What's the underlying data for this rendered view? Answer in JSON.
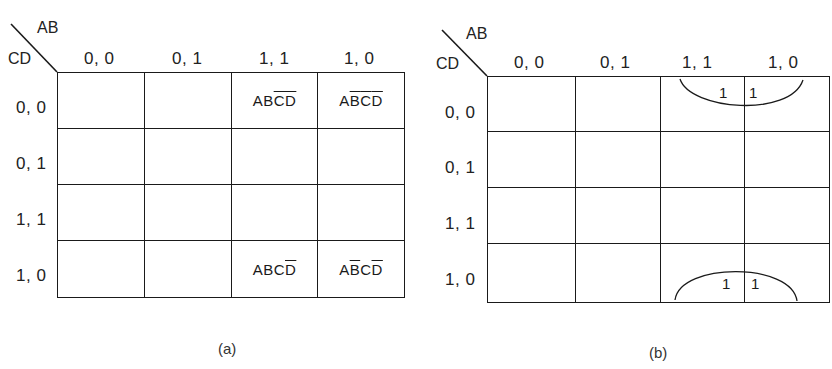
{
  "maps": [
    {
      "caption": "(a)",
      "row_var": "CD",
      "col_var": "AB",
      "col_headers": [
        "0, 0",
        "0, 1",
        "1, 1",
        "1, 0"
      ],
      "row_headers": [
        "0, 0",
        "0, 1",
        "1, 1",
        "1, 0"
      ],
      "cells": [
        [
          "",
          "",
          "ABC̄D̄",
          "AB̄C̄D̄"
        ],
        [
          "",
          "",
          "",
          ""
        ],
        [
          "",
          "",
          "",
          ""
        ],
        [
          "",
          "",
          "ABCD̄",
          "AB̄CD̄"
        ]
      ],
      "cell_terms": {
        "r0c2": [
          {
            "t": "A",
            "bar": false
          },
          {
            "t": "B",
            "bar": false
          },
          {
            "t": "C",
            "bar": true
          },
          {
            "t": "D",
            "bar": true
          }
        ],
        "r0c3": [
          {
            "t": "A",
            "bar": false
          },
          {
            "t": "B",
            "bar": true
          },
          {
            "t": "C",
            "bar": true
          },
          {
            "t": "D",
            "bar": true
          }
        ],
        "r3c2": [
          {
            "t": "A",
            "bar": false
          },
          {
            "t": "B",
            "bar": false
          },
          {
            "t": "C",
            "bar": false
          },
          {
            "t": "D",
            "bar": true
          }
        ],
        "r3c3": [
          {
            "t": "A",
            "bar": false
          },
          {
            "t": "B",
            "bar": true
          },
          {
            "t": "C",
            "bar": false
          },
          {
            "t": "D",
            "bar": true
          }
        ]
      }
    },
    {
      "caption": "(b)",
      "row_var": "CD",
      "col_var": "AB",
      "col_headers": [
        "0, 0",
        "0, 1",
        "1, 1",
        "1, 0"
      ],
      "row_headers": [
        "0, 0",
        "0, 1",
        "1, 1",
        "1, 0"
      ],
      "cells": [
        [
          "",
          "",
          "1",
          "1"
        ],
        [
          "",
          "",
          "",
          ""
        ],
        [
          "",
          "",
          "",
          ""
        ],
        [
          "",
          "",
          "1",
          "1"
        ]
      ],
      "groupings": [
        "top-edge half loop around row 0,0 cols 1,1 & 1,0",
        "bottom-edge half loop around row 1,0 cols 1,1 & 1,0"
      ]
    }
  ]
}
